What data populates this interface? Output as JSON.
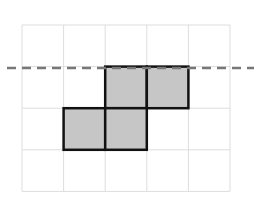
{
  "diagram": {
    "grid": {
      "cols": 5,
      "rows": 4,
      "origin_x": 22,
      "origin_y": 25,
      "cell": 41.6,
      "line_color": "#dddddd"
    },
    "shaded_cells": [
      {
        "col": 2,
        "row": 1
      },
      {
        "col": 3,
        "row": 1
      },
      {
        "col": 1,
        "row": 2
      },
      {
        "col": 2,
        "row": 2
      }
    ],
    "shade_color": "#c6c6c6",
    "outline_color": "#111111",
    "dashed_line": {
      "y": 68,
      "x1": 7,
      "x2": 254,
      "color": "#777777"
    }
  }
}
